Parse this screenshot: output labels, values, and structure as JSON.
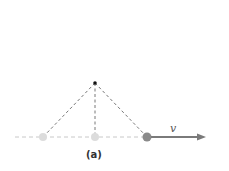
{
  "figure": {
    "caption": "(a)",
    "velocity_label": "v",
    "colors": {
      "dashed_lines": "#555555",
      "ground_line": "#c8c8c8",
      "ghost_ball": "#d9d9d9",
      "active_ball": "#8a8a8a",
      "arrow": "#7a7a7a",
      "pivot": "#111111"
    }
  }
}
